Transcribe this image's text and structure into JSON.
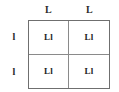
{
  "figure": {
    "kind": "punnett-square",
    "grid_size": "2x2",
    "border_color": "#6f6f6f",
    "divider_color": "#8a8a8a",
    "text_color": "#242424",
    "background_color": "#ffffff"
  },
  "column_headers": [
    {
      "label": "L"
    },
    {
      "label": "L"
    }
  ],
  "row_headers": [
    {
      "label": "l"
    },
    {
      "label": "l"
    }
  ],
  "cells": [
    [
      {
        "label": "Ll"
      },
      {
        "label": "Ll"
      }
    ],
    [
      {
        "label": "Ll"
      },
      {
        "label": "Ll"
      }
    ]
  ]
}
